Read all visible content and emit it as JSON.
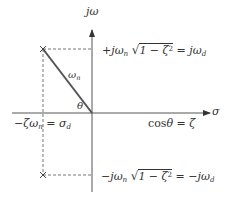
{
  "diagram": {
    "type": "s-plane pole diagram",
    "axes": {
      "vertical_label": "jω",
      "horizontal_label": "σ"
    },
    "poles": [
      {
        "name": "upper-pole",
        "marker": "×"
      },
      {
        "name": "lower-pole",
        "marker": "×"
      }
    ],
    "labels": {
      "upper_prefix": "+jω",
      "upper_sub": "n",
      "sqrt_content": "1 − ζ",
      "sqrt_sup": "2",
      "upper_rhs": "= jω",
      "upper_rhs_sub": "d",
      "lower_prefix": "−jω",
      "lower_sub": "n",
      "lower_rhs": "= −jω",
      "lower_rhs_sub": "d",
      "natural_freq": "ω",
      "natural_freq_sub": "n",
      "angle": "θ",
      "real_part": "−ζω",
      "real_part_sub": "n",
      "real_part_rhs": "= σ",
      "real_part_rhs_sub": "d",
      "cos_relation_fn": "cos",
      "cos_relation_rest": "θ = ζ"
    },
    "colors": {
      "axis": "#444444",
      "radius_line": "#555555",
      "dashed": "#666666",
      "text": "#333333"
    }
  }
}
